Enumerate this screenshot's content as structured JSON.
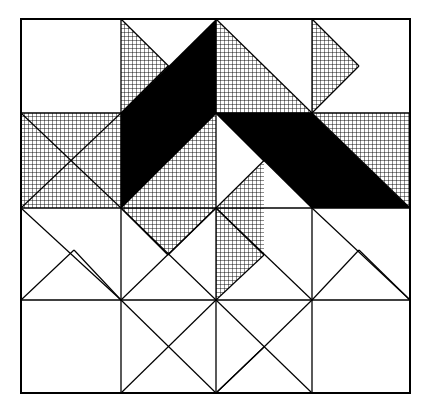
{
  "figure": {
    "kind": "quilt-block-diagram",
    "canvas": {
      "width": 432,
      "height": 416
    },
    "background_color": "#ffffff",
    "line_color": "#000000",
    "fill_black": "#000000",
    "fill_white": "#ffffff",
    "hatch_color": "#000000",
    "hatch_spacing_px": 4,
    "hatch_stroke_px": 0.9,
    "outer_border": {
      "x0": 21,
      "y0": 19,
      "x1": 410,
      "y1": 393,
      "stroke_width": 2.0
    },
    "grid": {
      "columns_x": [
        21,
        121,
        216,
        312,
        410
      ],
      "rows_y": [
        19,
        113,
        208,
        300,
        393
      ],
      "stroke_width": 1.3,
      "cell_count": "4x4"
    },
    "shapes": [
      {
        "name": "hatched-triangle-top-col2-left",
        "fill": "hatch",
        "points": "121,19 121,113 168,66"
      },
      {
        "name": "black-parallelogram-left",
        "fill": "black",
        "points": "216,19 121,113 121,208 216,113"
      },
      {
        "name": "hatched-triangle-top-col3-right",
        "fill": "hatch",
        "points": "216,19 312,113 216,113"
      },
      {
        "name": "hatched-triangle-top-col4-left",
        "fill": "hatch",
        "points": "312,19 312,113 359,66"
      },
      {
        "name": "hatched-triangle-left-upper",
        "fill": "hatch",
        "points": "21,113 121,113 21,208"
      },
      {
        "name": "hatched-triangle-left-lower",
        "fill": "hatch",
        "points": "21,208 121,113 121,208"
      },
      {
        "name": "black-parallelogram-right",
        "fill": "black",
        "points": "216,113 312,113 410,208 312,208"
      },
      {
        "name": "hatched-triangle-right-upper",
        "fill": "hatch",
        "points": "312,113 410,113 410,208"
      },
      {
        "name": "hatched-triangle-center-upper-left",
        "fill": "hatch",
        "points": "168,161 216,113 216,208"
      },
      {
        "name": "hatched-triangle-center-lower-right",
        "fill": "hatch",
        "points": "216,208 264,161 264,255"
      },
      {
        "name": "hatched-triangle-center-left-band",
        "fill": "hatch",
        "points": "121,208 168,161 216,208"
      },
      {
        "name": "hatched-triangle-below-center-left",
        "fill": "hatch",
        "points": "121,208 216,208 168,255"
      },
      {
        "name": "hatched-triangle-below-center-right",
        "fill": "hatch",
        "points": "216,208 264,255 216,300"
      }
    ],
    "outline_lines": [
      {
        "name": "diag-top-col2",
        "x1": 121,
        "y1": 19,
        "x2": 216,
        "y2": 113
      },
      {
        "name": "diag-top-col2-short",
        "x1": 168,
        "y1": 66,
        "x2": 121,
        "y2": 113
      },
      {
        "name": "diag-top-col3",
        "x1": 216,
        "y1": 19,
        "x2": 312,
        "y2": 113
      },
      {
        "name": "diag-top-col4",
        "x1": 312,
        "y1": 19,
        "x2": 359,
        "y2": 66
      },
      {
        "name": "diag-top-col4-b",
        "x1": 359,
        "y1": 66,
        "x2": 312,
        "y2": 113
      },
      {
        "name": "diag-left-row2",
        "x1": 21,
        "y1": 113,
        "x2": 121,
        "y2": 208
      },
      {
        "name": "diag-left-row2-b",
        "x1": 121,
        "y1": 113,
        "x2": 21,
        "y2": 208
      },
      {
        "name": "diag-right-row2",
        "x1": 312,
        "y1": 113,
        "x2": 410,
        "y2": 208
      },
      {
        "name": "diag-center-ul",
        "x1": 168,
        "y1": 161,
        "x2": 216,
        "y2": 113
      },
      {
        "name": "diag-center-ur",
        "x1": 216,
        "y1": 113,
        "x2": 264,
        "y2": 161
      },
      {
        "name": "diag-center-ll",
        "x1": 121,
        "y1": 208,
        "x2": 216,
        "y2": 113
      },
      {
        "name": "diag-center-lr",
        "x1": 216,
        "y1": 113,
        "x2": 312,
        "y2": 208
      },
      {
        "name": "diag-center-x1",
        "x1": 121,
        "y1": 208,
        "x2": 216,
        "y2": 300
      },
      {
        "name": "diag-center-x2",
        "x1": 216,
        "y1": 208,
        "x2": 312,
        "y2": 113
      },
      {
        "name": "diag-below-center-l",
        "x1": 121,
        "y1": 208,
        "x2": 168,
        "y2": 255
      },
      {
        "name": "diag-below-center-l2",
        "x1": 168,
        "y1": 255,
        "x2": 216,
        "y2": 208
      },
      {
        "name": "diag-below-center-r",
        "x1": 216,
        "y1": 208,
        "x2": 264,
        "y2": 255
      },
      {
        "name": "diag-below-center-r2",
        "x1": 264,
        "y1": 255,
        "x2": 216,
        "y2": 300
      },
      {
        "name": "diag-bl-cell-a",
        "x1": 21,
        "y1": 208,
        "x2": 121,
        "y2": 300
      },
      {
        "name": "diag-bl-cell-b",
        "x1": 21,
        "y1": 300,
        "x2": 74,
        "y2": 250
      },
      {
        "name": "diag-bl-cell-c",
        "x1": 74,
        "y1": 250,
        "x2": 121,
        "y2": 300
      },
      {
        "name": "diag-b2-cell",
        "x1": 121,
        "y1": 300,
        "x2": 216,
        "y2": 208
      },
      {
        "name": "diag-b2-cell-b",
        "x1": 216,
        "y1": 208,
        "x2": 312,
        "y2": 300
      },
      {
        "name": "diag-br-cell-a",
        "x1": 312,
        "y1": 208,
        "x2": 410,
        "y2": 300
      },
      {
        "name": "diag-br-cell-b",
        "x1": 312,
        "y1": 300,
        "x2": 359,
        "y2": 250
      },
      {
        "name": "diag-br-cell-c",
        "x1": 359,
        "y1": 250,
        "x2": 410,
        "y2": 300
      },
      {
        "name": "diag-row4-a",
        "x1": 121,
        "y1": 300,
        "x2": 216,
        "y2": 393
      },
      {
        "name": "diag-row4-b",
        "x1": 216,
        "y1": 300,
        "x2": 121,
        "y2": 393
      },
      {
        "name": "diag-row4-c",
        "x1": 216,
        "y1": 300,
        "x2": 312,
        "y2": 393
      },
      {
        "name": "diag-row4-d",
        "x1": 312,
        "y1": 300,
        "x2": 264,
        "y2": 347
      },
      {
        "name": "diag-row4-e",
        "x1": 264,
        "y1": 347,
        "x2": 216,
        "y2": 393
      },
      {
        "name": "diag-row4-f",
        "x1": 216,
        "y1": 393,
        "x2": 264,
        "y2": 347
      }
    ],
    "legend": {
      "black_label": "solid dark fabric",
      "hatch_label": "crosshatched medium fabric",
      "white_label": "plain light fabric"
    }
  }
}
